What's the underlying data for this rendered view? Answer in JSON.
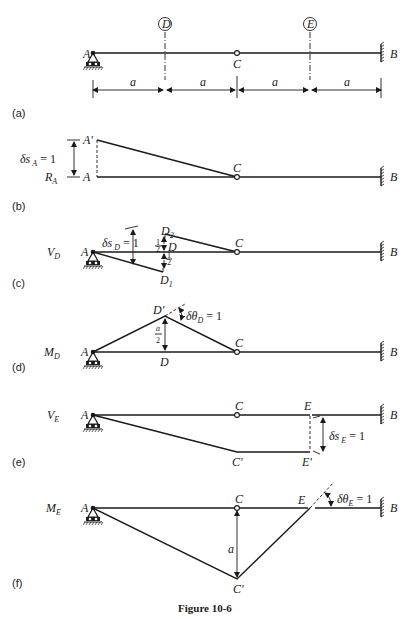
{
  "figure": {
    "caption": "Figure 10-6",
    "dimension_label": "a",
    "colors": {
      "ink": "#1a1a1a",
      "background": "#ffffff"
    }
  },
  "panel_a": {
    "label": "(a)",
    "point_A": "A",
    "point_B": "B",
    "point_C": "C",
    "section_D": "D",
    "section_E": "E",
    "spans": [
      "a",
      "a",
      "a",
      "a"
    ]
  },
  "panel_b": {
    "label": "(b)",
    "reaction": "R",
    "reaction_sub": "A",
    "point_A": "A",
    "point_A_prime": "A'",
    "point_C": "C",
    "point_B": "B",
    "displacement": "δs",
    "displacement_sub": "A",
    "displacement_value": "= 1"
  },
  "panel_c": {
    "label": "(c)",
    "quantity": "V",
    "quantity_sub": "D",
    "point_A": "A",
    "point_D": "D",
    "point_D1": "D",
    "point_D1_sub": "1",
    "point_D2": "D",
    "point_D2_sub": "2",
    "point_C": "C",
    "point_B": "B",
    "displacement": "δs",
    "displacement_sub": "D",
    "displacement_value": "= 1",
    "half_up_num": "1",
    "half_up_den": "2",
    "half_down_num": "1",
    "half_down_den": "2"
  },
  "panel_d": {
    "label": "(d)",
    "quantity": "M",
    "quantity_sub": "D",
    "point_A": "A",
    "point_D": "D",
    "point_D_prime": "D'",
    "point_C": "C",
    "point_B": "B",
    "rotation": "δθ",
    "rotation_sub": "D",
    "rotation_value": "= 1",
    "height_num": "a",
    "height_den": "2"
  },
  "panel_e": {
    "label": "(e)",
    "quantity": "V",
    "quantity_sub": "E",
    "point_A": "A",
    "point_C": "C",
    "point_C_prime": "C'",
    "point_E": "E",
    "point_E_prime": "E'",
    "point_B": "B",
    "displacement": "δs",
    "displacement_sub": "E",
    "displacement_value": "= 1"
  },
  "panel_f": {
    "label": "(f)",
    "quantity": "M",
    "quantity_sub": "E",
    "point_A": "A",
    "point_C": "C",
    "point_C_prime": "C'",
    "point_E": "E",
    "point_B": "B",
    "rotation": "δθ",
    "rotation_sub": "E",
    "rotation_value": "= 1",
    "height": "a"
  }
}
